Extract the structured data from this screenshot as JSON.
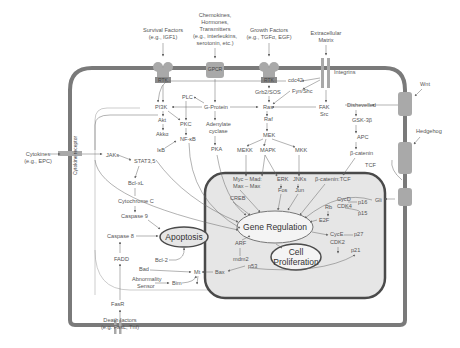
{
  "external_signals": {
    "survival": [
      "Survival Factors",
      "(e.g., IGF1)"
    ],
    "chemokines": [
      "Chemokines,",
      "Hormones,",
      "Transmitters",
      "(e.g., interleukins,",
      "serotonin, etc.)"
    ],
    "growth": [
      "Growth Factors",
      "(e.g., TGFα, EGF)"
    ],
    "ecm": [
      "Extracellular",
      "Matrix"
    ],
    "wnt": "Wnt",
    "hedgehog": "Hedgehog",
    "cytokines": [
      "Cytokines",
      "(e.g., EPC)"
    ],
    "death": [
      "Death factors",
      "(e.g. FasL, Tnf)"
    ]
  },
  "receptors": {
    "rtk1": "RTK",
    "gpcr": "GPCR",
    "rtk2": "RTK",
    "integrins": "Integrins",
    "frizzled": "Frizzled",
    "patched": "Patched",
    "smo": "SMO",
    "cytokine_receptor": "Cytokine receptor",
    "fasr": "FasR"
  },
  "nodes": {
    "plc": "PLC",
    "pi3k": "PI3K",
    "gprotein": "G-Protein",
    "ras": "Ras",
    "grb2": "Grb2/SOS",
    "cdc42": "cdc42",
    "fyn": "Fyn/Shc",
    "fak": "FAK",
    "src": "Src",
    "akt": "Akt",
    "pkc": "PKC",
    "adenylate": [
      "Adenylate",
      "cyclase"
    ],
    "raf": "Raf",
    "akkα": "Akkα",
    "nfkb": "NF-κB",
    "ikb": "IκB",
    "pka": "PKA",
    "mek": "MEK",
    "mekk": "MEKK",
    "mapk": "MAPK",
    "mkk": "MKK",
    "dishevelled": "Dishevelled",
    "gsk3b": "GSK-3β",
    "apc": "APC",
    "bcatenin": "β-catenin",
    "tcf": "TCF",
    "jaks": "JAKs",
    "stat": "STAT3,5",
    "bclxl": "Bcl-xL",
    "cytc": "Cytochrome C",
    "casp9": "Caspase 9",
    "casp8": "Caspase 8",
    "fadd": "FADD",
    "bad": "Bad",
    "bcl2": "Bcl-2",
    "abnormality": [
      "Abnormality",
      "Sensor"
    ],
    "bim": "Bim",
    "mt": "Mt",
    "bax": "Bax",
    "myc1": "Myc – Mad:",
    "myc2": "Max – Max",
    "erk": "ERK",
    "fos": "Fos",
    "jnks": "JNKs",
    "jun": "Jun",
    "bcattcf": "β-catenin:TCF",
    "creb": "CREB",
    "cycd": "CycD",
    "cdk4": "CDK4",
    "p16": "p16",
    "p15": "p15",
    "rb": "Rb",
    "e2f": "E2F",
    "gli": "Gli",
    "cyce": "CycE",
    "cdk2": "CDK2",
    "p27": "p27",
    "p21": "p21",
    "arf": "ARF",
    "mdm2": "mdm2",
    "p53": "p53"
  },
  "outcomes": {
    "apoptosis": "Apoptosis",
    "gene_regulation": "Gene Regulation",
    "cell_prolif": [
      "Cell",
      "Proliferation"
    ]
  },
  "colors": {
    "membrane": "#7a7a7a",
    "receptor": "#a9a9a9",
    "nucleus_fill": "#e6e6e6",
    "nucleus_border": "#4a4a4a",
    "text": "#555555"
  }
}
